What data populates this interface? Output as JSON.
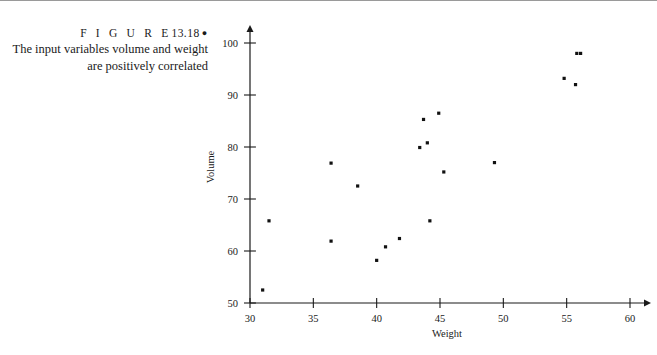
{
  "figure": {
    "label_word": "F I G U R E",
    "number": "13.18",
    "bullet": "●",
    "caption_line1": "The input variables volume and weight",
    "caption_line2": "are positively correlated"
  },
  "chart_data": {
    "type": "scatter",
    "title": "",
    "xlabel": "Weight",
    "ylabel": "Volume",
    "xlim": [
      30,
      60
    ],
    "ylim": [
      50,
      100
    ],
    "xticks": [
      30,
      35,
      40,
      45,
      50,
      55,
      60
    ],
    "yticks": [
      50,
      60,
      70,
      80,
      90,
      100
    ],
    "xtick_labels": [
      "30",
      "35",
      "40",
      "45",
      "50",
      "55",
      "60"
    ],
    "ytick_labels": [
      "50",
      "60",
      "70",
      "80",
      "90",
      "100"
    ],
    "grid": false,
    "legend": null,
    "marker": "square",
    "marker_color": "#111111",
    "series": [
      {
        "name": "volume vs weight",
        "points": [
          {
            "x": 31.0,
            "y": 52.5
          },
          {
            "x": 31.5,
            "y": 65.8
          },
          {
            "x": 36.4,
            "y": 76.9
          },
          {
            "x": 36.4,
            "y": 61.9
          },
          {
            "x": 38.5,
            "y": 72.5
          },
          {
            "x": 40.0,
            "y": 58.2
          },
          {
            "x": 40.7,
            "y": 60.8
          },
          {
            "x": 41.8,
            "y": 62.4
          },
          {
            "x": 43.4,
            "y": 79.9
          },
          {
            "x": 43.7,
            "y": 85.3
          },
          {
            "x": 44.0,
            "y": 80.8
          },
          {
            "x": 44.2,
            "y": 65.8
          },
          {
            "x": 44.9,
            "y": 86.5
          },
          {
            "x": 45.3,
            "y": 75.2
          },
          {
            "x": 49.3,
            "y": 77.0
          },
          {
            "x": 54.8,
            "y": 93.2
          },
          {
            "x": 55.7,
            "y": 92.0
          },
          {
            "x": 55.8,
            "y": 98.0
          },
          {
            "x": 56.1,
            "y": 98.0
          }
        ]
      }
    ]
  },
  "colors": {
    "ink": "#1a1a1a",
    "rule": "#9a9a9a",
    "marker": "#111111"
  }
}
